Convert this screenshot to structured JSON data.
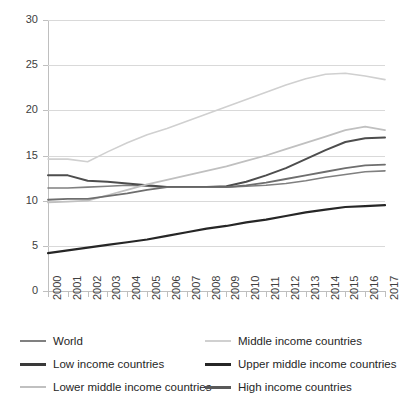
{
  "chart_data": {
    "type": "line",
    "title": "",
    "xlabel": "",
    "ylabel": "",
    "ylim": [
      0,
      30
    ],
    "ytick_step": 5,
    "grid": true,
    "legend_position": "bottom",
    "x": [
      2000,
      2001,
      2002,
      2003,
      2004,
      2005,
      2006,
      2007,
      2008,
      2009,
      2010,
      2011,
      2012,
      2013,
      2014,
      2015,
      2016,
      2017
    ],
    "xtick_labels": [
      "2000",
      "2001",
      "2002",
      "2003",
      "2004",
      "2005",
      "2006",
      "2007",
      "2008",
      "2009",
      "2010",
      "2011",
      "2012",
      "2013",
      "2014",
      "2015",
      "2016",
      "2017"
    ],
    "ytick_labels": [
      "0",
      "5",
      "10",
      "15",
      "20",
      "25",
      "30"
    ],
    "series": [
      {
        "name": "World",
        "color": "#808080",
        "width": 1.6,
        "values": [
          11.4,
          11.4,
          11.5,
          11.6,
          11.7,
          11.6,
          11.5,
          11.5,
          11.5,
          11.5,
          11.6,
          11.7,
          11.9,
          12.2,
          12.6,
          12.9,
          13.2,
          13.3
        ]
      },
      {
        "name": "Middle income countries",
        "color": "#d0d0d0",
        "width": 1.6,
        "values": [
          14.6,
          14.6,
          14.3,
          15.4,
          16.4,
          17.3,
          18.0,
          18.8,
          19.6,
          20.4,
          21.2,
          22.0,
          22.8,
          23.5,
          24.0,
          24.1,
          23.8,
          23.4
        ]
      },
      {
        "name": "Low income countries",
        "color": "#262626",
        "width": 2.2,
        "values": [
          4.2,
          4.5,
          4.8,
          5.1,
          5.4,
          5.7,
          6.1,
          6.5,
          6.9,
          7.2,
          7.6,
          7.9,
          8.3,
          8.7,
          9.0,
          9.3,
          9.4,
          9.5
        ]
      },
      {
        "name": "Upper middle income countries",
        "color": "#4d4d4d",
        "width": 2.0,
        "values": [
          12.8,
          12.8,
          12.2,
          12.1,
          11.9,
          11.7,
          11.5,
          11.5,
          11.5,
          11.6,
          12.1,
          12.8,
          13.6,
          14.6,
          15.6,
          16.5,
          16.9,
          17.0
        ]
      },
      {
        "name": "Lower middle income countries",
        "color": "#c0c0c0",
        "width": 1.8,
        "values": [
          9.8,
          9.9,
          10.0,
          10.6,
          11.2,
          11.8,
          12.3,
          12.8,
          13.3,
          13.8,
          14.4,
          15.0,
          15.7,
          16.4,
          17.1,
          17.8,
          18.2,
          17.8
        ]
      },
      {
        "name": "High income countries",
        "color": "#6e6e6e",
        "width": 1.8,
        "values": [
          10.1,
          10.2,
          10.2,
          10.5,
          10.8,
          11.2,
          11.5,
          11.5,
          11.5,
          11.5,
          11.7,
          12.0,
          12.4,
          12.8,
          13.2,
          13.6,
          13.9,
          14.0
        ]
      }
    ]
  },
  "legend": {
    "entries": [
      {
        "label": "World",
        "color": "#808080",
        "thickness": 2
      },
      {
        "label": "Middle income countries",
        "color": "#d0d0d0",
        "thickness": 2
      },
      {
        "label": "Low income countries",
        "color": "#3a3a3a",
        "thickness": 3
      },
      {
        "label": "Upper middle income countries",
        "color": "#262626",
        "thickness": 3
      },
      {
        "label": "Lower middle income countries",
        "color": "#c0c0c0",
        "thickness": 2
      },
      {
        "label": "High income countries",
        "color": "#595959",
        "thickness": 3
      }
    ]
  }
}
